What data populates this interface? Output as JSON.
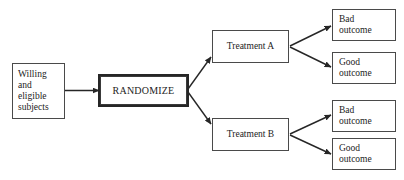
{
  "diagram": {
    "type": "flowchart",
    "background_color": "#ffffff",
    "line_color": "#262626",
    "text_color": "#1c1c1c",
    "box_border_color": "#4a4a4a",
    "nodes": {
      "subjects": {
        "label": "Willing\nand\neligible\nsubjects",
        "shape": "rectangle",
        "align": "left"
      },
      "randomize": {
        "label": "RANDOMIZE",
        "shape": "rectangle-thick",
        "align": "center"
      },
      "treatment_a": {
        "label": "Treatment A",
        "shape": "rectangle",
        "align": "center"
      },
      "treatment_b": {
        "label": "Treatment B",
        "shape": "rectangle",
        "align": "center"
      },
      "outcome_a_bad": {
        "label": "Bad\noutcome",
        "shape": "rectangle",
        "align": "left"
      },
      "outcome_a_good": {
        "label": "Good\noutcome",
        "shape": "rectangle",
        "align": "left"
      },
      "outcome_b_bad": {
        "label": "Bad\noutcome",
        "shape": "rectangle",
        "align": "left"
      },
      "outcome_b_good": {
        "label": "Good\noutcome",
        "shape": "rectangle",
        "align": "left"
      }
    },
    "edges": [
      {
        "name": "subjects-to-randomize",
        "from": "subjects",
        "to": "randomize",
        "label": ""
      },
      {
        "name": "randomize-to-treatment-a",
        "from": "randomize",
        "to": "treatment_a",
        "label": ""
      },
      {
        "name": "randomize-to-treatment-b",
        "from": "randomize",
        "to": "treatment_b",
        "label": ""
      },
      {
        "name": "treatment-a-to-bad-outcome",
        "from": "treatment_a",
        "to": "outcome_a_bad",
        "label": ""
      },
      {
        "name": "treatment-a-to-good-outcome",
        "from": "treatment_a",
        "to": "outcome_a_good",
        "label": ""
      },
      {
        "name": "treatment-b-to-bad-outcome",
        "from": "treatment_b",
        "to": "outcome_b_bad",
        "label": ""
      },
      {
        "name": "treatment-b-to-good-outcome",
        "from": "treatment_b",
        "to": "outcome_b_good",
        "label": ""
      }
    ]
  }
}
